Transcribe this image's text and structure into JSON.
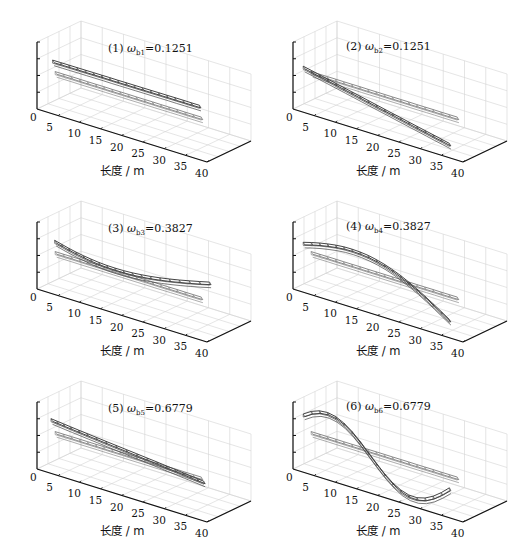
{
  "figure": {
    "panels": [
      {
        "index": "(1)",
        "omega_label": "ω",
        "omega_sub": "b1",
        "value": "=0.1251",
        "mode": "lateral-1"
      },
      {
        "index": "(2)",
        "omega_label": "ω",
        "omega_sub": "b2",
        "value": "=0.1251",
        "mode": "vertical-1"
      },
      {
        "index": "(3)",
        "omega_label": "ω",
        "omega_sub": "b3",
        "value": "=0.3827",
        "mode": "lateral-2"
      },
      {
        "index": "(4)",
        "omega_label": "ω",
        "omega_sub": "b4",
        "value": "=0.3827",
        "mode": "vertical-2"
      },
      {
        "index": "(5)",
        "omega_label": "ω",
        "omega_sub": "b5",
        "value": "=0.6779",
        "mode": "lateral-3"
      },
      {
        "index": "(6)",
        "omega_label": "ω",
        "omega_sub": "b6",
        "value": "=0.6779",
        "mode": "vertical-3"
      }
    ],
    "xticks": [
      "0",
      "5",
      "10",
      "15",
      "20",
      "25",
      "30",
      "35",
      "40"
    ],
    "xlabel": "长度 / m"
  },
  "chart_data": [
    {
      "type": "line",
      "title": "(1) ω_b1=0.1251",
      "xlabel": "长度 / m",
      "xticks": [
        0,
        5,
        10,
        15,
        20,
        25,
        30,
        35,
        40
      ],
      "xlim": [
        0,
        40
      ],
      "series": [
        {
          "name": "undeformed",
          "x": [
            2,
            38
          ],
          "y": [
            0,
            0
          ]
        },
        {
          "name": "mode shape",
          "x": [
            2,
            38
          ],
          "y": [
            0.05,
            0.1
          ]
        }
      ],
      "grid": true
    },
    {
      "type": "line",
      "title": "(2) ω_b2=0.1251",
      "xlabel": "长度 / m",
      "xticks": [
        0,
        5,
        10,
        15,
        20,
        25,
        30,
        35,
        40
      ],
      "xlim": [
        0,
        40
      ],
      "series": [
        {
          "name": "undeformed",
          "x": [
            2,
            38
          ],
          "y": [
            0,
            0
          ]
        },
        {
          "name": "mode shape",
          "x": [
            2,
            38
          ],
          "y": [
            0,
            -0.35
          ]
        }
      ],
      "grid": true
    },
    {
      "type": "line",
      "title": "(3) ω_b3=0.3827",
      "xlabel": "长度 / m",
      "xticks": [
        0,
        5,
        10,
        15,
        20,
        25,
        30,
        35,
        40
      ],
      "xlim": [
        0,
        40
      ],
      "series": [
        {
          "name": "undeformed",
          "x": [
            2,
            38
          ],
          "y": [
            0,
            0
          ]
        },
        {
          "name": "mode shape",
          "x": [
            2,
            10,
            20,
            30,
            38
          ],
          "y": [
            0,
            -0.1,
            -0.15,
            -0.05,
            0.1
          ]
        }
      ],
      "grid": true
    },
    {
      "type": "line",
      "title": "(4) ω_b4=0.3827",
      "xlabel": "长度 / m",
      "xticks": [
        0,
        5,
        10,
        15,
        20,
        25,
        30,
        35,
        40
      ],
      "xlim": [
        0,
        40
      ],
      "series": [
        {
          "name": "undeformed",
          "x": [
            2,
            38
          ],
          "y": [
            0,
            0
          ]
        },
        {
          "name": "mode shape",
          "x": [
            2,
            8,
            14,
            20,
            26,
            32,
            38
          ],
          "y": [
            0.1,
            0.35,
            0.3,
            0,
            -0.3,
            -0.45,
            -0.45
          ]
        }
      ],
      "grid": true
    },
    {
      "type": "line",
      "title": "(5) ω_b5=0.6779",
      "xlabel": "长度 / m",
      "xticks": [
        0,
        5,
        10,
        15,
        20,
        25,
        30,
        35,
        40
      ],
      "xlim": [
        0,
        40
      ],
      "series": [
        {
          "name": "undeformed",
          "x": [
            2,
            38
          ],
          "y": [
            0,
            0
          ]
        },
        {
          "name": "mode shape",
          "x": [
            2,
            8,
            14,
            20,
            26,
            32,
            38
          ],
          "y": [
            0,
            -0.15,
            -0.1,
            0,
            0.05,
            -0.2,
            -0.3
          ]
        }
      ],
      "grid": true
    },
    {
      "type": "line",
      "title": "(6) ω_b6=0.6779",
      "xlabel": "长度 / m",
      "xticks": [
        0,
        5,
        10,
        15,
        20,
        25,
        30,
        35,
        40
      ],
      "xlim": [
        0,
        40
      ],
      "series": [
        {
          "name": "undeformed",
          "x": [
            2,
            38
          ],
          "y": [
            0,
            0
          ]
        },
        {
          "name": "mode shape",
          "x": [
            2,
            8,
            14,
            20,
            26,
            32,
            38
          ],
          "y": [
            0,
            0.4,
            0.1,
            -0.45,
            -0.5,
            0,
            0.25
          ]
        }
      ],
      "grid": true
    }
  ]
}
